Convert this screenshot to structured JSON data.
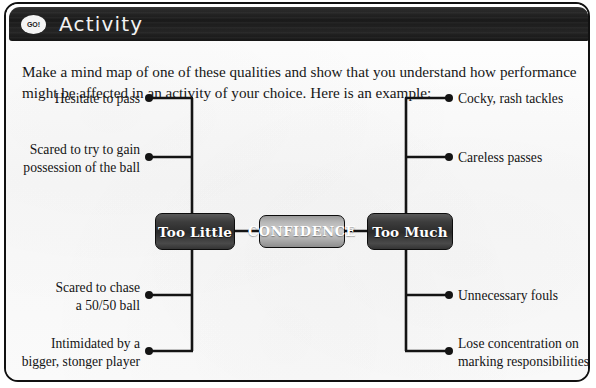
{
  "header": {
    "badge_label": "GO!",
    "badge_icon": "go-circle-icon",
    "title": "Activity",
    "background_color": "#1a1a1a",
    "text_color": "#f2f2f2"
  },
  "intro": {
    "text": "Make a mind map of one of these qualities and show that you understand how performance might be affected in an activity of your choice. Here is an example:"
  },
  "mindmap": {
    "center_node": {
      "label": "CONFIDENCE",
      "style": "light",
      "color": "#cfcfcf"
    },
    "branch_nodes": [
      {
        "label": "Too Little",
        "side": "left",
        "style": "dark",
        "color": "#2b2b2b"
      },
      {
        "label": "Too Much",
        "side": "right",
        "style": "dark",
        "color": "#2b2b2b"
      }
    ],
    "leaves_left": [
      {
        "line1": "Hesitate to pass",
        "line2": ""
      },
      {
        "line1": "Scared to try to gain",
        "line2": "possession of the ball"
      },
      {
        "line1": "Scared to chase",
        "line2": "a 50/50 ball"
      },
      {
        "line1": "Intimidated by a",
        "line2": "bigger, stonger player"
      }
    ],
    "leaves_right": [
      {
        "line1": "Cocky, rash tackles",
        "line2": ""
      },
      {
        "line1": "Careless passes",
        "line2": ""
      },
      {
        "line1": "Unnecessary fouls",
        "line2": ""
      },
      {
        "line1": "Lose concentration on",
        "line2": "marking responsibilities"
      }
    ],
    "connector_color": "#141414",
    "node_marker": "filled-dot"
  },
  "card": {
    "border_color": "#111111",
    "background_color": "#fbfbfb"
  }
}
